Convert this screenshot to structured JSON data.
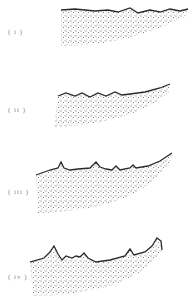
{
  "figure": {
    "panels": [
      {
        "label": "( i )",
        "label_pos": [
          8,
          28
        ]
      },
      {
        "label": "( ii )",
        "label_pos": [
          8,
          106
        ]
      },
      {
        "label": "( iii )",
        "label_pos": [
          8,
          188
        ]
      },
      {
        "label": "( iv )",
        "label_pos": [
          8,
          273
        ]
      }
    ],
    "colors": {
      "outline": "#2a2a2a",
      "stipple": "#555555",
      "label": "#888888",
      "background": "#ffffff"
    }
  }
}
